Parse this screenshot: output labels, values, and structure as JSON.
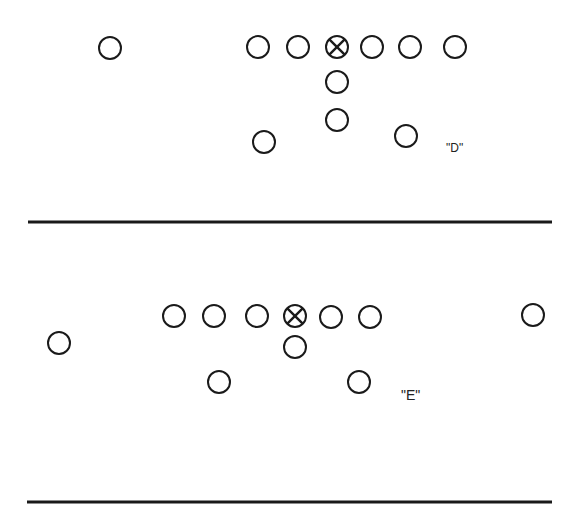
{
  "diagram": {
    "type": "football-formations",
    "formations": [
      {
        "id": "D",
        "label": "\"D\"",
        "label_pos": [
          446,
          141
        ],
        "center": [
          337,
          47
        ],
        "players": [
          [
            110,
            48
          ],
          [
            258,
            47
          ],
          [
            298,
            47
          ],
          [
            372,
            47
          ],
          [
            410,
            47
          ],
          [
            455,
            47
          ],
          [
            337,
            82
          ],
          [
            337,
            120
          ],
          [
            264,
            142
          ],
          [
            406,
            136
          ]
        ],
        "divider_line": {
          "x1": 28,
          "x2": 552,
          "y": 222
        }
      },
      {
        "id": "E",
        "label": "\"E\"",
        "label_pos": [
          401,
          387
        ],
        "center": [
          295,
          316
        ],
        "players": [
          [
            174,
            316
          ],
          [
            214,
            316
          ],
          [
            257,
            316
          ],
          [
            331,
            317
          ],
          [
            370,
            317
          ],
          [
            533,
            315
          ],
          [
            59,
            343
          ],
          [
            295,
            347
          ],
          [
            219,
            382
          ],
          [
            359,
            382
          ]
        ],
        "divider_line": {
          "x1": 27,
          "x2": 552,
          "y": 502
        }
      }
    ],
    "player_radius": 11,
    "colors": {
      "ink": "#1a1a1a",
      "background": "#ffffff"
    }
  }
}
